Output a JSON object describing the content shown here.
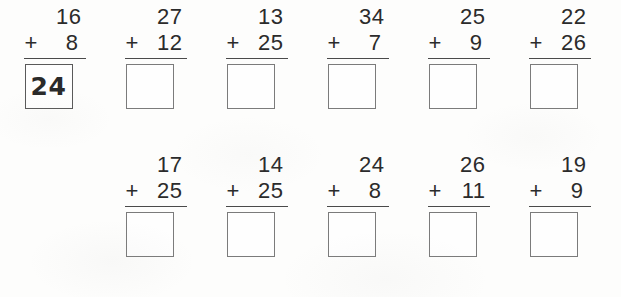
{
  "worksheet": {
    "columns": 6,
    "plus_sign": "+",
    "rows": [
      {
        "row_label": "row-1",
        "start_column": 0,
        "problems": [
          {
            "top": "16",
            "bottom": "8",
            "answer": "24",
            "filled": true
          },
          {
            "top": "27",
            "bottom": "12",
            "answer": "",
            "filled": false
          },
          {
            "top": "13",
            "bottom": "25",
            "answer": "",
            "filled": false
          },
          {
            "top": "34",
            "bottom": "7",
            "answer": "",
            "filled": false
          },
          {
            "top": "25",
            "bottom": "9",
            "answer": "",
            "filled": false
          },
          {
            "top": "22",
            "bottom": "26",
            "answer": "",
            "filled": false
          }
        ]
      },
      {
        "row_label": "row-2",
        "start_column": 1,
        "problems": [
          {
            "top": "17",
            "bottom": "25",
            "answer": "",
            "filled": false
          },
          {
            "top": "14",
            "bottom": "25",
            "answer": "",
            "filled": false
          },
          {
            "top": "24",
            "bottom": "8",
            "answer": "",
            "filled": false
          },
          {
            "top": "26",
            "bottom": "11",
            "answer": "",
            "filled": false
          },
          {
            "top": "19",
            "bottom": "9",
            "answer": "",
            "filled": false
          }
        ]
      }
    ]
  },
  "colors": {
    "page_background": "#fdfdfc",
    "printed_digit": "#2b2b2b",
    "rule_line": "#4a4a4a",
    "box_border": "#7b7b7b",
    "box_border_filled": "#5a5a5a",
    "handwritten_answer": "#2a2a2a"
  }
}
